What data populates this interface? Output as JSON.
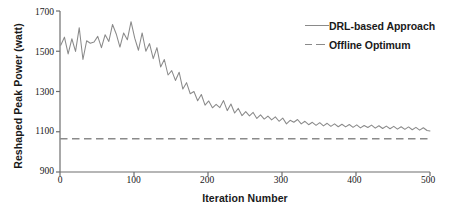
{
  "chart_data": {
    "type": "line",
    "title": "",
    "xlabel": "Iteration Number",
    "ylabel": "Reshaped Peak Power (watt)",
    "xlim": [
      0,
      500
    ],
    "ylim": [
      900,
      1700
    ],
    "xticks": [
      0,
      100,
      200,
      300,
      400,
      500
    ],
    "yticks": [
      900,
      1100,
      1300,
      1500,
      1700
    ],
    "grid": false,
    "legend_position": "top-right",
    "series": [
      {
        "name": "DRL-based Approach",
        "style": "solid",
        "color": "#8a8a8a",
        "x": [
          1,
          6,
          11,
          16,
          21,
          26,
          31,
          36,
          41,
          46,
          51,
          56,
          61,
          66,
          71,
          76,
          81,
          86,
          91,
          96,
          101,
          106,
          111,
          116,
          121,
          126,
          131,
          136,
          141,
          146,
          151,
          156,
          161,
          166,
          171,
          176,
          181,
          186,
          191,
          196,
          201,
          206,
          211,
          216,
          221,
          226,
          231,
          236,
          241,
          246,
          251,
          256,
          261,
          266,
          271,
          276,
          281,
          286,
          291,
          296,
          301,
          306,
          311,
          316,
          321,
          326,
          331,
          336,
          341,
          346,
          351,
          356,
          361,
          366,
          371,
          376,
          381,
          386,
          391,
          396,
          401,
          406,
          411,
          416,
          421,
          426,
          431,
          436,
          441,
          446,
          451,
          456,
          461,
          466,
          471,
          476,
          481,
          486,
          491,
          496,
          500
        ],
        "y": [
          1530,
          1570,
          1487,
          1562,
          1499,
          1617,
          1459,
          1552,
          1540,
          1546,
          1574,
          1518,
          1582,
          1549,
          1633,
          1586,
          1521,
          1591,
          1557,
          1647,
          1565,
          1505,
          1591,
          1500,
          1538,
          1463,
          1518,
          1422,
          1459,
          1382,
          1404,
          1355,
          1396,
          1312,
          1344,
          1289,
          1300,
          1254,
          1285,
          1232,
          1253,
          1219,
          1236,
          1220,
          1255,
          1205,
          1238,
          1193,
          1216,
          1180,
          1200,
          1179,
          1196,
          1166,
          1184,
          1163,
          1178,
          1159,
          1174,
          1152,
          1168,
          1139,
          1157,
          1147,
          1161,
          1139,
          1152,
          1135,
          1147,
          1132,
          1145,
          1129,
          1142,
          1127,
          1139,
          1125,
          1137,
          1124,
          1136,
          1122,
          1134,
          1119,
          1131,
          1121,
          1133,
          1118,
          1130,
          1116,
          1128,
          1115,
          1127,
          1113,
          1125,
          1112,
          1124,
          1110,
          1122,
          1108,
          1120,
          1106,
          1104
        ]
      },
      {
        "name": "Offline Optimum",
        "style": "dashed",
        "color": "#8a8a8a",
        "constant_value": 1065
      }
    ]
  },
  "legend": {
    "items": [
      {
        "label": "DRL-based Approach",
        "style": "solid"
      },
      {
        "label": "Offline Optimum",
        "style": "dashed"
      }
    ]
  },
  "axes": {
    "y_title": "Reshaped Peak Power (watt)",
    "x_title": "Iteration Number",
    "y_tick_labels": [
      "1700",
      "1500",
      "1300",
      "1100",
      "900"
    ],
    "x_tick_labels": [
      "0",
      "100",
      "200",
      "300",
      "400",
      "500"
    ]
  },
  "colors": {
    "line": "#8a8a8a",
    "axis": "#6e6e6e",
    "text": "#1a1a1a",
    "background": "#ffffff"
  }
}
